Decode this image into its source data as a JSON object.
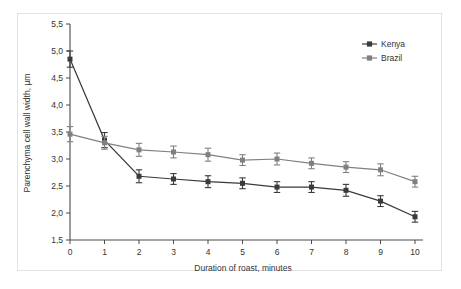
{
  "chart_data": {
    "type": "line",
    "title": "",
    "xlabel": "Duration of roast, minutes",
    "ylabel": "Parenchyma cell wall width, µm",
    "x": [
      0,
      1,
      2,
      3,
      4,
      5,
      6,
      7,
      8,
      9,
      10
    ],
    "xtick_labels": [
      "0",
      "1",
      "2",
      "3",
      "4",
      "5",
      "6",
      "7",
      "8",
      "9",
      "10"
    ],
    "ytick_labels": [
      "1,5",
      "2,0",
      "2,5",
      "3,0",
      "3,5",
      "4,0",
      "4,5",
      "5,0",
      "5,5"
    ],
    "ytick_values": [
      1.5,
      2.0,
      2.5,
      3.0,
      3.5,
      4.0,
      4.5,
      5.0,
      5.5
    ],
    "xlim": [
      0,
      10
    ],
    "ylim": [
      1.5,
      5.5
    ],
    "grid": false,
    "legend_position": "top-right",
    "decimal_separator": ",",
    "series": [
      {
        "name": "Kenya",
        "color": "#3a3a3a",
        "marker": "square",
        "values": [
          4.85,
          3.35,
          2.68,
          2.63,
          2.58,
          2.55,
          2.48,
          2.48,
          2.42,
          2.22,
          1.93
        ],
        "errors": [
          0.15,
          0.14,
          0.12,
          0.1,
          0.11,
          0.1,
          0.1,
          0.1,
          0.11,
          0.1,
          0.1
        ]
      },
      {
        "name": "Brazil",
        "color": "#808080",
        "marker": "square",
        "values": [
          3.46,
          3.3,
          3.17,
          3.13,
          3.08,
          2.98,
          3.0,
          2.92,
          2.85,
          2.8,
          2.58
        ],
        "errors": [
          0.14,
          0.12,
          0.12,
          0.11,
          0.12,
          0.1,
          0.11,
          0.1,
          0.1,
          0.11,
          0.1
        ]
      }
    ]
  },
  "legend": {
    "items": [
      {
        "label": "Kenya",
        "color": "#3a3a3a"
      },
      {
        "label": "Brazil",
        "color": "#808080"
      }
    ]
  },
  "axes": {
    "x_title": "Duration of roast, minutes",
    "y_title": "Parenchyma cell wall width, µm"
  }
}
